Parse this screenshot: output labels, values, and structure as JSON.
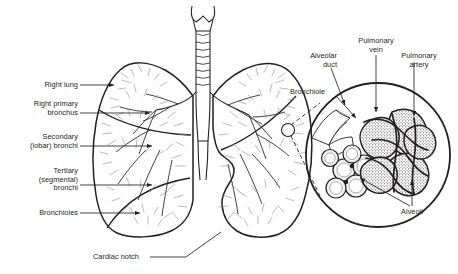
{
  "figure": {
    "background_color": "#ffffff",
    "ink_color": "#231f20",
    "caption": ""
  },
  "labels": {
    "right_lung": "Right lung",
    "right_primary_bronchus": "Right primary\nbronchus",
    "secondary_lobar_bronchi": "Secondary\n(lobar) bronchi",
    "tertiary_segmental_bronchi": "Tertiary\n(segmental)\nbronchi",
    "bronchioles": "Bronchioles",
    "cardiac_notch": "Cardiac notch",
    "alveolar_duct": "Alveolar\nduct",
    "bronchiole": "Bronchiole",
    "pulmonary_vein": "Pulmonary\nvein",
    "pulmonary_artery": "Pulmonary\nartery",
    "alveoli": "Alveoli"
  },
  "structures": {
    "trachea": "trachea",
    "larynx": "larynx",
    "left_lung": "left lung",
    "right_lung": "right lung",
    "detail_circle": "alveolar-detail-inset",
    "capillary_network": "capillary network",
    "alveolar_sacs": "alveolar sacs"
  }
}
